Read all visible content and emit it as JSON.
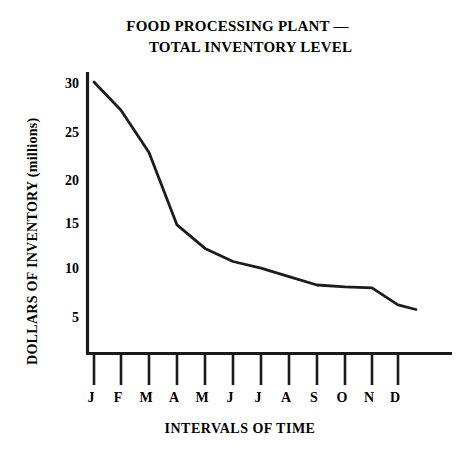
{
  "chart_data": {
    "type": "line",
    "title": "FOOD PROCESSING PLANT — TOTAL INVENTORY LEVEL",
    "title_line_1": "FOOD PROCESSING PLANT —",
    "title_line_2": "TOTAL INVENTORY LEVEL",
    "xlabel": "INTERVALS OF TIME",
    "ylabel": "DOLLARS OF INVENTORY (millions)",
    "categories": [
      "J",
      "F",
      "M",
      "A",
      "M",
      "J",
      "J",
      "A",
      "S",
      "O",
      "N",
      "D"
    ],
    "category_names": [
      "January",
      "February",
      "March",
      "April",
      "May",
      "June",
      "July",
      "August",
      "September",
      "October",
      "November",
      "December"
    ],
    "values": [
      30.0,
      27.0,
      22.5,
      14.8,
      12.3,
      10.9,
      10.2,
      9.3,
      8.4,
      8.2,
      8.1,
      6.3
    ],
    "series": [
      {
        "name": "Total Inventory Level",
        "values": [
          30.0,
          27.0,
          22.5,
          14.8,
          12.3,
          10.9,
          10.2,
          9.3,
          8.4,
          8.2,
          8.1,
          6.3
        ]
      }
    ],
    "end_value": 5.8,
    "yticks": [
      5,
      10,
      15,
      20,
      25,
      30
    ],
    "ylim": [
      0,
      31
    ],
    "xlim": [
      0,
      13
    ],
    "grid": false,
    "legend": false,
    "line_color": "#1c1c1c",
    "axis_color": "#1a1a1a",
    "background_color": "#ffffff"
  }
}
